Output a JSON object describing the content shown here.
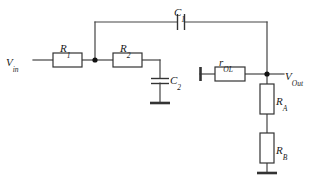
{
  "diagram": {
    "type": "electronic-schematic",
    "colors": {
      "wire": "#444444",
      "component_stroke": "#333333",
      "component_fill": "#ffffff",
      "node_dot": "#111111",
      "label_text": "#1a1a1a",
      "background": "#ffffff"
    },
    "labels": {
      "v_in": {
        "base": "V",
        "sub": "in",
        "x": 6,
        "y": 52
      },
      "r1": {
        "base": "R",
        "sub": "1",
        "x": 60,
        "y": 38
      },
      "r2": {
        "base": "R",
        "sub": "2",
        "x": 120,
        "y": 38
      },
      "c1": {
        "base": "C",
        "sub": "1",
        "x": 174,
        "y": 2
      },
      "c2": {
        "base": "C",
        "sub": "2",
        "x": 170,
        "y": 70
      },
      "r_ol": {
        "base": "r",
        "sub": "OL",
        "x": 219,
        "y": 52
      },
      "v_out": {
        "base": "V",
        "sub": "Out",
        "x": 285,
        "y": 66
      },
      "r_a": {
        "base": "R",
        "sub": "A",
        "x": 276,
        "y": 91
      },
      "r_b": {
        "base": "R",
        "sub": "B",
        "x": 276,
        "y": 140
      }
    },
    "components": [
      {
        "name": "resistor-r1",
        "kind": "resistor",
        "orientation": "horizontal",
        "x": 53,
        "y": 53,
        "w": 29,
        "h": 14
      },
      {
        "name": "resistor-r2",
        "kind": "resistor",
        "orientation": "horizontal",
        "x": 113,
        "y": 53,
        "w": 29,
        "h": 14
      },
      {
        "name": "resistor-rol",
        "kind": "resistor",
        "orientation": "horizontal",
        "x": 215,
        "y": 67,
        "w": 30,
        "h": 14
      },
      {
        "name": "resistor-ra",
        "kind": "resistor",
        "orientation": "vertical",
        "x": 260,
        "y": 84,
        "w": 14,
        "h": 30
      },
      {
        "name": "resistor-rb",
        "kind": "resistor",
        "orientation": "vertical",
        "x": 260,
        "y": 133,
        "w": 14,
        "h": 30
      },
      {
        "name": "capacitor-c1",
        "kind": "capacitor",
        "orientation": "horizontal",
        "x": 181,
        "y": 22
      },
      {
        "name": "capacitor-c2",
        "kind": "capacitor",
        "orientation": "vertical",
        "x": 160,
        "y": 80
      }
    ],
    "nodes": [
      {
        "name": "node-rc-junction",
        "x": 95,
        "y": 60
      },
      {
        "name": "node-vout",
        "x": 267,
        "y": 74
      }
    ],
    "grounds": [
      {
        "name": "ground-c2",
        "x": 160,
        "y": 103
      },
      {
        "name": "ground-rb",
        "x": 267,
        "y": 173
      }
    ],
    "terminals": [
      {
        "name": "terminal-rol-left",
        "x": 200,
        "y": 74
      }
    ]
  }
}
